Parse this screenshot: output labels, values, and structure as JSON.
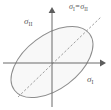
{
  "figure": {
    "background_color": "#ffffff",
    "axes": {
      "horizontal": {
        "label_sigma": "σ",
        "label_subscript": "I",
        "arrow": "right",
        "color": "#6b6b6b"
      },
      "vertical": {
        "label_sigma": "σ",
        "label_subscript": "II",
        "arrow": "up",
        "color": "#6b6b6b"
      },
      "origin": {
        "x": 52,
        "y": 63
      }
    },
    "ellipse": {
      "name": "yield-locus-ellipse",
      "center": {
        "x": 52,
        "y": 62
      },
      "radius_major": 47,
      "radius_minor": 27,
      "rotation_deg": -37,
      "stroke_color": "#8a8a8a",
      "fill_color": "#f7f7f7"
    },
    "diagonal_line": {
      "name": "hydrostatic-line",
      "label_sigma_left": "σ",
      "label_subscript_left": "I",
      "equals": "=",
      "label_sigma_right": "σ",
      "label_subscript_right": "II",
      "style": "dashed",
      "stroke_color": "#9a9a9a",
      "start": {
        "x": 18,
        "y": 97
      },
      "end": {
        "x": 101,
        "y": 17
      }
    }
  }
}
